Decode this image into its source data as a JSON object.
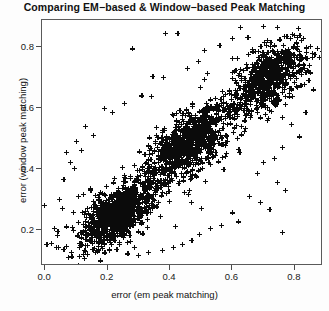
{
  "chart_data": {
    "type": "scatter",
    "title": "Comparing EM−based & Window−based Peak Matching",
    "xlabel": "error (em peak matching)",
    "ylabel": "error (window peak matching)",
    "xlim": [
      -0.01,
      0.89
    ],
    "ylim": [
      0.08,
      0.89
    ],
    "xticks": [
      0.0,
      0.2,
      0.4,
      0.6,
      0.8
    ],
    "xticklabels": [
      "0.0",
      "0.2",
      "0.4",
      "0.6",
      "0.8"
    ],
    "yticks": [
      0.2,
      0.4,
      0.6,
      0.8
    ],
    "yticklabels": [
      "0.2",
      "0.4",
      "0.6",
      "0.8"
    ],
    "grid": false,
    "legend": null,
    "marker": "+",
    "marker_color": "#0b0b0b",
    "point_count": 2600,
    "correlation": 0.87,
    "clusters": [
      {
        "name": "low-error cluster",
        "cx": 0.235,
        "cy": 0.255,
        "sx": 0.055,
        "sy": 0.05,
        "rho": 0.62,
        "n": 980
      },
      {
        "name": "mid-error cluster",
        "cx": 0.455,
        "cy": 0.485,
        "sx": 0.06,
        "sy": 0.058,
        "rho": 0.6,
        "n": 760
      },
      {
        "name": "high-error cluster",
        "cx": 0.715,
        "cy": 0.705,
        "sx": 0.06,
        "sy": 0.058,
        "rho": 0.55,
        "n": 620
      },
      {
        "name": "diagonal spread",
        "cx": 0.46,
        "cy": 0.47,
        "sx": 0.19,
        "sy": 0.185,
        "rho": 0.9,
        "n": 240
      }
    ],
    "outliers": [
      [
        0.385,
        0.845
      ],
      [
        0.425,
        0.845
      ],
      [
        0.625,
        0.865
      ],
      [
        0.7,
        0.87
      ],
      [
        0.28,
        0.795
      ],
      [
        0.51,
        0.79
      ],
      [
        0.56,
        0.805
      ],
      [
        0.6,
        0.83
      ],
      [
        0.345,
        0.705
      ],
      [
        0.38,
        0.7
      ],
      [
        0.455,
        0.73
      ],
      [
        0.49,
        0.755
      ],
      [
        0.19,
        0.6
      ],
      [
        0.215,
        0.585
      ],
      [
        0.255,
        0.615
      ],
      [
        0.31,
        0.64
      ],
      [
        0.13,
        0.54
      ],
      [
        0.155,
        0.51
      ],
      [
        0.1,
        0.49
      ],
      [
        0.115,
        0.46
      ],
      [
        0.068,
        0.455
      ],
      [
        0.08,
        0.42
      ],
      [
        0.095,
        0.4
      ],
      [
        0.06,
        0.365
      ],
      [
        0.045,
        0.3
      ],
      [
        0.055,
        0.27
      ],
      [
        0.03,
        0.205
      ],
      [
        0.04,
        0.18
      ],
      [
        0.02,
        0.155
      ],
      [
        0.035,
        0.14
      ],
      [
        0.06,
        0.135
      ],
      [
        0.085,
        0.125
      ],
      [
        0.82,
        0.76
      ],
      [
        0.845,
        0.69
      ],
      [
        0.86,
        0.66
      ],
      [
        0.835,
        0.585
      ],
      [
        0.79,
        0.545
      ],
      [
        0.815,
        0.505
      ],
      [
        0.76,
        0.47
      ],
      [
        0.735,
        0.435
      ],
      [
        0.7,
        0.42
      ],
      [
        0.68,
        0.385
      ],
      [
        0.745,
        0.355
      ],
      [
        0.77,
        0.33
      ],
      [
        0.655,
        0.31
      ],
      [
        0.69,
        0.29
      ],
      [
        0.72,
        0.265
      ],
      [
        0.76,
        0.19
      ],
      [
        0.6,
        0.255
      ],
      [
        0.62,
        0.225
      ],
      [
        0.565,
        0.215
      ],
      [
        0.53,
        0.205
      ],
      [
        0.495,
        0.185
      ],
      [
        0.47,
        0.165
      ],
      [
        0.44,
        0.15
      ],
      [
        0.41,
        0.14
      ],
      [
        0.375,
        0.13
      ],
      [
        0.33,
        0.125
      ],
      [
        0.3,
        0.115
      ],
      [
        0.265,
        0.12
      ],
      [
        0.23,
        0.135
      ],
      [
        0.205,
        0.13
      ],
      [
        0.17,
        0.145
      ],
      [
        0.145,
        0.16
      ]
    ]
  }
}
